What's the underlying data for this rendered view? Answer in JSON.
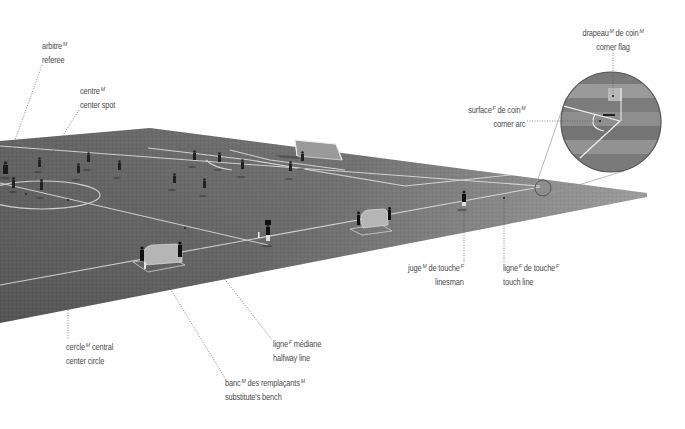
{
  "figure": {
    "type": "labeled illustration",
    "colors": {
      "background": "#ffffff",
      "pitch_light": "#8a8a8a",
      "pitch_dark": "#5e5e5e",
      "pitch_lines": "#e6e6e6",
      "label_text": "#4a4a4a",
      "leader_line": "#555555"
    }
  },
  "labels": {
    "referee": {
      "fr": "arbitre",
      "fr_gender": "M",
      "en": "referee"
    },
    "center_spot": {
      "fr": "centre",
      "fr_gender": "M",
      "en": "center spot"
    },
    "corner_flag": {
      "fr": "drapeau",
      "fr_gender": "M",
      "fr_suffix": " de coin",
      "fr_suffix_gender": "M",
      "en": "corner flag"
    },
    "corner_arc": {
      "fr": "surface",
      "fr_gender": "F",
      "fr_suffix": " de coin",
      "fr_suffix_gender": "M",
      "en": "corner arc"
    },
    "linesman": {
      "fr": "juge",
      "fr_gender": "M",
      "fr_suffix": " de touche",
      "fr_suffix_gender": "F",
      "en": "linesman"
    },
    "touch_line": {
      "fr": "ligne",
      "fr_gender": "F",
      "fr_suffix": " de touche",
      "fr_suffix_gender": "F",
      "en": "touch line"
    },
    "center_circle": {
      "fr": "cercle",
      "fr_gender": "M",
      "fr_suffix": " central",
      "en": "center circle"
    },
    "halfway_line": {
      "fr": "ligne",
      "fr_gender": "F",
      "fr_suffix": " médiane",
      "en": "halfway line"
    },
    "substitutes_bench": {
      "fr": "banc",
      "fr_gender": "M",
      "fr_suffix": " des remplaçants",
      "fr_suffix_gender": "M",
      "en": "substitute's bench"
    }
  }
}
